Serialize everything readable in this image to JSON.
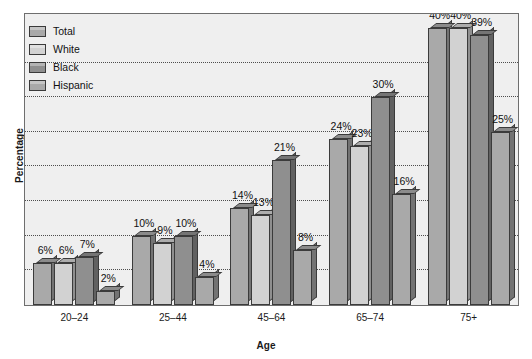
{
  "chart_data": {
    "type": "bar",
    "title": "",
    "xlabel": "Age",
    "ylabel": "Percentage",
    "categories": [
      "20–24",
      "25–44",
      "45–64",
      "65–74",
      "75+"
    ],
    "series": [
      {
        "name": "Total",
        "values": [
          6,
          10,
          14,
          24,
          40
        ],
        "color": "#a9a9a9"
      },
      {
        "name": "White",
        "values": [
          6,
          9,
          13,
          23,
          40
        ],
        "color": "#d2d2d2"
      },
      {
        "name": "Black",
        "values": [
          7,
          10,
          21,
          30,
          39
        ],
        "color": "#8f8f8f"
      },
      {
        "name": "Hispanic",
        "values": [
          2,
          4,
          8,
          16,
          25
        ],
        "color": "#a9a9a9"
      }
    ],
    "data_labels": [
      [
        "6%",
        "6%",
        "7%",
        "2%"
      ],
      [
        "10%",
        "9%",
        "10%",
        "4%"
      ],
      [
        "14%",
        "13%",
        "21%",
        "8%"
      ],
      [
        "24%",
        "23%",
        "30%",
        "16%"
      ],
      [
        "40%",
        "40%",
        "39%",
        "25%"
      ]
    ],
    "ylim": [
      0,
      42
    ],
    "gridlines": [
      5,
      10,
      15,
      20,
      25,
      30,
      35
    ],
    "grid": true,
    "y_tick_labels_shown": false,
    "legend_position": "top-left-inside",
    "style": "3d-grayscale",
    "plot_background": "#efefef",
    "frame_color": "#6e6e6e",
    "grid_color": "#4d4d4d"
  },
  "legend": {
    "items": [
      {
        "label": "Total"
      },
      {
        "label": "White"
      },
      {
        "label": "Black"
      },
      {
        "label": "Hispanic"
      }
    ]
  }
}
